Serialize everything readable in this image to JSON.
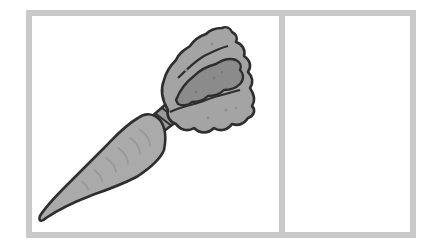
{
  "figure": {
    "panels": [
      {
        "id": "left",
        "content": "carrot",
        "description": "carrot illustration"
      },
      {
        "id": "right",
        "content": "empty",
        "description": ""
      }
    ],
    "colors": {
      "frame": "#c9c9c9",
      "background": "#ffffff",
      "outline": "#2e2e2e",
      "carrot_body": "#a9a9a9",
      "carrot_ridges": "#969696",
      "leaf_light": "#a3a3a3",
      "leaf_dark": "#8a8a8a",
      "stem": "#9a9a9a"
    }
  }
}
